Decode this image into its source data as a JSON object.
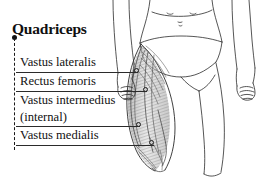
{
  "diagram": {
    "title": "Quadriceps",
    "style": "grayscale line drawing with hatched muscle shading",
    "background_color": "#ffffff",
    "line_color": "#2b2b2b",
    "muscle_shade_color": "#7d7d7d"
  },
  "labels": [
    {
      "id": "vastus-lateralis",
      "text": "Vastus lateralis",
      "row_top": 53,
      "rule_y": 72,
      "rule_left": 16,
      "rule_right": 138,
      "endpoint_x": 136,
      "endpoint_y": 70
    },
    {
      "id": "rectus-femoris",
      "text": "Rectus femoris",
      "row_top": 72,
      "rule_y": 91,
      "rule_left": 16,
      "rule_right": 147,
      "endpoint_x": 145,
      "endpoint_y": 89
    },
    {
      "id": "vastus-intermedius",
      "text": "Vastus intermedius",
      "text_secondary": "(internal)",
      "row_top": 91,
      "row_top_secondary": 108,
      "rule_y": 126,
      "rule_left": 16,
      "rule_right": 140,
      "endpoint_x": 138,
      "endpoint_y": 124
    },
    {
      "id": "vastus-medialis",
      "text": "Vastus medialis",
      "row_top": 126,
      "rule_y": 145,
      "rule_left": 16,
      "rule_right": 154,
      "endpoint_x": 151,
      "endpoint_y": 142
    }
  ],
  "bracket": {
    "name": "quadriceps-group-bracket",
    "style": "dashed"
  },
  "figure_parts": [
    {
      "id": "torso",
      "label": "lower torso"
    },
    {
      "id": "navel",
      "label": "navel"
    },
    {
      "id": "briefs",
      "label": "briefs"
    },
    {
      "id": "left-arm",
      "label": "left arm with closed hand"
    },
    {
      "id": "right-arm",
      "label": "right arm with closed hand"
    },
    {
      "id": "right-thigh-muscles",
      "label": "right thigh with quadriceps shown"
    },
    {
      "id": "left-thigh",
      "label": "left thigh outline"
    }
  ]
}
